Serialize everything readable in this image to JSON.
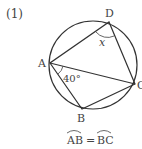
{
  "problem_number": "(1)",
  "points": {
    "A": {
      "label": "A",
      "x": 50,
      "y": 63
    },
    "B": {
      "label": "B",
      "x": 82,
      "y": 109
    },
    "C": {
      "label": "C",
      "x": 135,
      "y": 84
    },
    "D": {
      "label": "D",
      "x": 109,
      "y": 22
    }
  },
  "circle": {
    "cx": 93,
    "cy": 65,
    "r": 44
  },
  "angle_labels": {
    "angle_BAC": "40°",
    "angle_ADC": "x"
  },
  "condition": {
    "left_arc": "AB",
    "equals": "=",
    "right_arc": "BC"
  },
  "colors": {
    "stroke": "#333333",
    "text": "#444444"
  }
}
